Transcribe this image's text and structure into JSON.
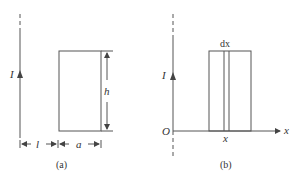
{
  "figure_a": {
    "caption": "(a)",
    "current_label": "I",
    "height_label": "h",
    "distance_label": "l",
    "width_label": "a"
  },
  "figure_b": {
    "caption": "(b)",
    "current_label": "I",
    "origin_label": "O",
    "axis_label": "x",
    "strip_label": "dx",
    "position_label": "x"
  }
}
